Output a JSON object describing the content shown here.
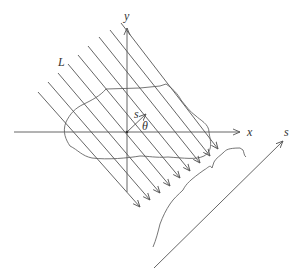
{
  "diagram": {
    "labels": {
      "x_axis": "x",
      "y_axis": "y",
      "ray_label": "L",
      "s_vector": "s",
      "angle": "θ",
      "projection_axis": "s"
    },
    "colors": {
      "line": "#555555",
      "text": "#333333",
      "background": "#ffffff"
    },
    "origin": [
      127,
      132
    ],
    "ray_count": 9
  }
}
